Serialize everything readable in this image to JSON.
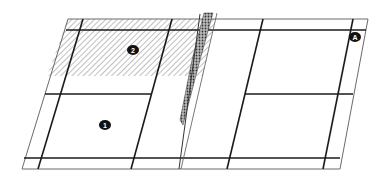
{
  "diagram": {
    "type": "court-plan-with-fold",
    "colors": {
      "background": "#ffffff",
      "line": "#1a1a1a",
      "thin_line": "#6a6a6a",
      "hatch": "#8a8a8a",
      "marker": "#111111",
      "marker_text": "#ffffff"
    },
    "markers": [
      {
        "id": "marker-1",
        "label": "1",
        "x": 105,
        "y": 125
      },
      {
        "id": "marker-2",
        "label": "2",
        "x": 133,
        "y": 50
      },
      {
        "id": "marker-a",
        "label": "A",
        "x": 355,
        "y": 37
      }
    ],
    "regions": [
      {
        "name": "hatched-area",
        "label": "2"
      },
      {
        "name": "plain-area",
        "label": "1"
      },
      {
        "name": "fold",
        "label": ""
      }
    ]
  }
}
